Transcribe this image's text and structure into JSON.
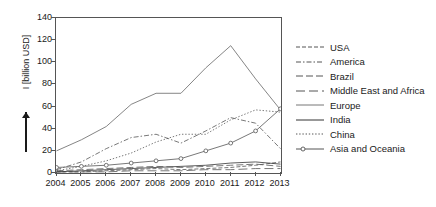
{
  "chart_data": {
    "type": "line",
    "title": "",
    "xlabel": "",
    "ylabel": "I [billion USD]",
    "x": [
      2004,
      2005,
      2006,
      2007,
      2008,
      2009,
      2010,
      2011,
      2012,
      2013
    ],
    "xtick_labels": [
      "2004",
      "2005",
      "2006",
      "2007",
      "2008",
      "2009",
      "2010",
      "2011",
      "2012",
      "2013"
    ],
    "ytick_labels": [
      "0",
      "20",
      "40",
      "60",
      "80",
      "100",
      "120",
      "140"
    ],
    "yticks": [
      0,
      20,
      40,
      60,
      80,
      100,
      120,
      140
    ],
    "ylim": [
      0,
      140
    ],
    "xlim": [
      2004,
      2013
    ],
    "grid": false,
    "legend_position": "right",
    "series": [
      {
        "name": "USA",
        "style": "dashed",
        "color": "#555555",
        "marker": "none",
        "values": [
          1,
          1,
          2,
          3,
          4,
          3,
          4,
          5,
          7,
          10
        ]
      },
      {
        "name": "America",
        "style": "dash-dot",
        "color": "#555555",
        "marker": "none",
        "values": [
          3,
          10,
          22,
          32,
          35,
          27,
          38,
          50,
          45,
          22
        ]
      },
      {
        "name": "Brazil",
        "style": "long-dash",
        "color": "#555555",
        "marker": "none",
        "values": [
          2,
          3,
          4,
          5,
          6,
          5,
          6,
          7,
          8,
          6
        ]
      },
      {
        "name": "Middle East and Africa",
        "style": "wide-dash",
        "color": "#555555",
        "marker": "none",
        "values": [
          1,
          1,
          1,
          2,
          2,
          2,
          3,
          3,
          4,
          4
        ]
      },
      {
        "name": "Europe",
        "style": "solid",
        "color": "#777777",
        "marker": "none",
        "values": [
          20,
          30,
          42,
          62,
          72,
          72,
          95,
          115,
          85,
          57
        ]
      },
      {
        "name": "India",
        "style": "solid",
        "color": "#333333",
        "marker": "none",
        "values": [
          1,
          2,
          3,
          4,
          5,
          6,
          7,
          9,
          10,
          8
        ]
      },
      {
        "name": "China",
        "style": "dotted",
        "color": "#555555",
        "marker": "none",
        "values": [
          2,
          6,
          11,
          18,
          28,
          35,
          35,
          48,
          57,
          55
        ]
      },
      {
        "name": "Asia and Oceania",
        "style": "solid-marker",
        "color": "#555555",
        "marker": "circle",
        "values": [
          5,
          6,
          7,
          9,
          11,
          13,
          20,
          27,
          38,
          58
        ]
      }
    ]
  }
}
